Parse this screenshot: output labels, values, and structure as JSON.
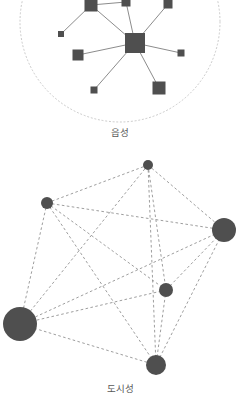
{
  "figure": {
    "background_color": "#ffffff",
    "node_color": "#4f4f4f",
    "edge_color": "#8c8c8c",
    "boundary_color": "#c9c9c9",
    "caption_color": "#585858"
  },
  "panels": [
    {
      "id": "rural",
      "caption": "읍성",
      "boundary_shape": "dotted-circle",
      "node_shape": "square",
      "edge_style": "solid",
      "chart_data": {
        "type": "scatter",
        "title": "읍성",
        "xlabel": "",
        "ylabel": "",
        "layout": "star / hub-and-spoke network",
        "node_shape": "square",
        "edge_style": "solid",
        "boundary": {
          "shape": "circle",
          "style": "dotted",
          "cx": 120,
          "cy": 22,
          "r": 100
        },
        "nodes": [
          {
            "id": "n1",
            "x": 91,
            "y": 5,
            "size": 13
          },
          {
            "id": "n2",
            "x": 126,
            "y": 2,
            "size": 9
          },
          {
            "id": "n3",
            "x": 168,
            "y": 4,
            "size": 9
          },
          {
            "id": "n4",
            "x": 61,
            "y": 34,
            "size": 6
          },
          {
            "id": "hub",
            "x": 135,
            "y": 43,
            "size": 20
          },
          {
            "id": "n5",
            "x": 78,
            "y": 55,
            "size": 11
          },
          {
            "id": "n6",
            "x": 181,
            "y": 53,
            "size": 7
          },
          {
            "id": "n7",
            "x": 94,
            "y": 90,
            "size": 7
          },
          {
            "id": "n8",
            "x": 159,
            "y": 88,
            "size": 13
          }
        ],
        "edges": [
          [
            "hub",
            "n1"
          ],
          [
            "hub",
            "n2"
          ],
          [
            "hub",
            "n3"
          ],
          [
            "hub",
            "n5"
          ],
          [
            "hub",
            "n6"
          ],
          [
            "hub",
            "n7"
          ],
          [
            "hub",
            "n8"
          ],
          [
            "n1",
            "n2"
          ],
          [
            "n1",
            "n4"
          ]
        ]
      }
    },
    {
      "id": "urban",
      "caption": "도시성",
      "boundary_shape": "none",
      "node_shape": "circle",
      "edge_style": "dashed",
      "chart_data": {
        "type": "scatter",
        "title": "도시성",
        "xlabel": "",
        "ylabel": "",
        "layout": "dense mesh / near-complete graph",
        "node_shape": "circle",
        "edge_style": "dashed",
        "nodes": [
          {
            "id": "u1",
            "x": 148,
            "y": 15,
            "r": 5
          },
          {
            "id": "u2",
            "x": 47,
            "y": 53,
            "r": 6
          },
          {
            "id": "u3",
            "x": 224,
            "y": 80,
            "r": 12
          },
          {
            "id": "u4",
            "x": 166,
            "y": 140,
            "r": 7
          },
          {
            "id": "u5",
            "x": 20,
            "y": 174,
            "r": 17
          },
          {
            "id": "u6",
            "x": 156,
            "y": 215,
            "r": 10
          }
        ],
        "edges": [
          [
            "u1",
            "u2"
          ],
          [
            "u1",
            "u3"
          ],
          [
            "u1",
            "u4"
          ],
          [
            "u1",
            "u5"
          ],
          [
            "u1",
            "u6"
          ],
          [
            "u2",
            "u3"
          ],
          [
            "u2",
            "u4"
          ],
          [
            "u2",
            "u5"
          ],
          [
            "u2",
            "u6"
          ],
          [
            "u3",
            "u4"
          ],
          [
            "u3",
            "u5"
          ],
          [
            "u3",
            "u6"
          ],
          [
            "u4",
            "u5"
          ],
          [
            "u4",
            "u6"
          ],
          [
            "u5",
            "u6"
          ]
        ]
      }
    }
  ]
}
